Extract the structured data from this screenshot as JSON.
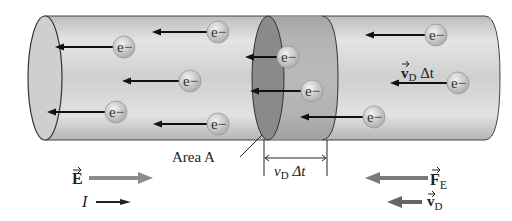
{
  "diagram": {
    "type": "conductor-drift-velocity",
    "electron_label": "e−",
    "labels": {
      "area": "Area A",
      "vd_dt_bracket": "v",
      "vd_dt_sub": "D",
      "vd_dt_tail": " Δt",
      "vd_dt_arrow_main": "v",
      "vd_dt_arrow_sub": "D",
      "vd_dt_arrow_tail": " Δt",
      "E_field": "E",
      "current": "I",
      "force_main": "F",
      "force_sub": "E",
      "drift_main": "v",
      "drift_sub": "D"
    },
    "colors": {
      "cylinder_light": "#e6e6e6",
      "cylinder_dark": "#a8a8a8",
      "slice": "#8a8a8a",
      "electron": "#c8c8c8",
      "arrow": "#111111",
      "gray_arrow": "#8c8c8c"
    },
    "electrons": [
      {
        "x": 218,
        "y": 32,
        "arrow_to": 152
      },
      {
        "x": 124,
        "y": 47,
        "arrow_to": 55
      },
      {
        "x": 190,
        "y": 81,
        "arrow_to": 122
      },
      {
        "x": 116,
        "y": 112,
        "arrow_to": 47
      },
      {
        "x": 218,
        "y": 124,
        "arrow_to": 153
      },
      {
        "x": 288,
        "y": 57,
        "arrow_to": 245
      },
      {
        "x": 312,
        "y": 91,
        "arrow_to": 250
      },
      {
        "x": 374,
        "y": 117,
        "arrow_to": 300
      },
      {
        "x": 436,
        "y": 35,
        "arrow_to": 365
      },
      {
        "x": 458,
        "y": 83,
        "arrow_to": 390
      }
    ]
  }
}
